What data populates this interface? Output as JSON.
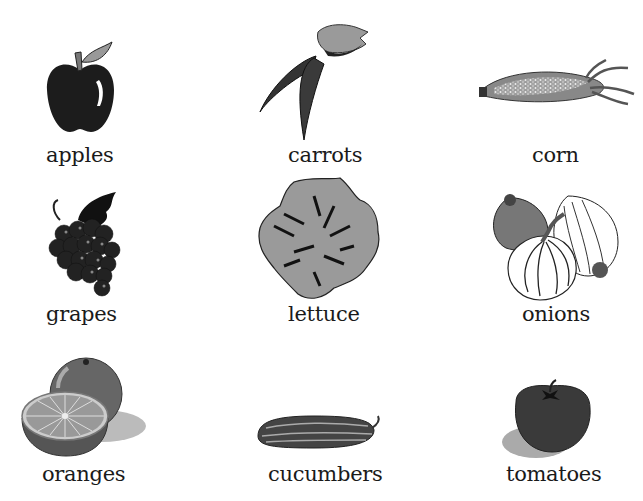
{
  "items": [
    {
      "label": "apples",
      "icon": "apple-icon"
    },
    {
      "label": "carrots",
      "icon": "carrot-icon"
    },
    {
      "label": "corn",
      "icon": "corn-icon"
    },
    {
      "label": "grapes",
      "icon": "grapes-icon"
    },
    {
      "label": "lettuce",
      "icon": "lettuce-icon"
    },
    {
      "label": "onions",
      "icon": "onion-icon"
    },
    {
      "label": "oranges",
      "icon": "orange-icon"
    },
    {
      "label": "cucumbers",
      "icon": "cucumber-icon"
    },
    {
      "label": "tomatoes",
      "icon": "tomato-icon"
    }
  ]
}
